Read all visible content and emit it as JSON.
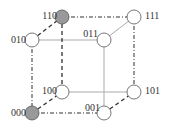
{
  "diagram": {
    "nodes": [
      {
        "id": "110",
        "label": "110",
        "highlighted": true
      },
      {
        "id": "111",
        "label": "111",
        "highlighted": false
      },
      {
        "id": "010",
        "label": "010",
        "highlighted": false
      },
      {
        "id": "011",
        "label": "011",
        "highlighted": false
      },
      {
        "id": "100",
        "label": "100",
        "highlighted": false
      },
      {
        "id": "101",
        "label": "101",
        "highlighted": false
      },
      {
        "id": "000",
        "label": "000",
        "highlighted": true
      },
      {
        "id": "001",
        "label": "001",
        "highlighted": false
      }
    ],
    "edges": [
      {
        "from": "110",
        "to": "111",
        "style": "dashdot"
      },
      {
        "from": "010",
        "to": "110",
        "style": "dashed"
      },
      {
        "from": "010",
        "to": "011",
        "style": "solid"
      },
      {
        "from": "011",
        "to": "111",
        "style": "solid"
      },
      {
        "from": "010",
        "to": "000",
        "style": "dashdot"
      },
      {
        "from": "110",
        "to": "100",
        "style": "dashed"
      },
      {
        "from": "111",
        "to": "101",
        "style": "dashdot"
      },
      {
        "from": "011",
        "to": "001",
        "style": "solid"
      },
      {
        "from": "100",
        "to": "101",
        "style": "solid"
      },
      {
        "from": "000",
        "to": "100",
        "style": "dashed"
      },
      {
        "from": "000",
        "to": "001",
        "style": "dashdot"
      },
      {
        "from": "001",
        "to": "101",
        "style": "dashed"
      }
    ],
    "colors": {
      "highlight": "#999999",
      "node": "#ffffff",
      "stroke": "#555555",
      "solid_edge": "#aaaaaa"
    }
  }
}
